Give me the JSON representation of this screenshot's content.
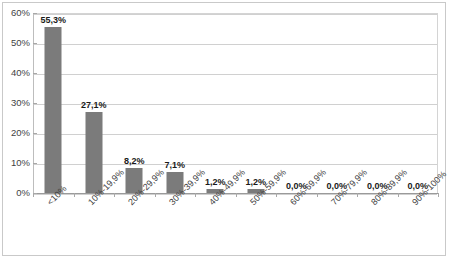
{
  "chart_data": {
    "type": "bar",
    "title": "",
    "subtitle": "",
    "xlabel": "",
    "ylabel": "",
    "categories": [
      "<10%",
      "10%-19,9%",
      "20%-29,9%",
      "30%-39,9%",
      "40%-49,9%",
      "50%-59,9%",
      "60%-69,9%",
      "70%-79,9%",
      "80%-89,9%",
      "90%-100%"
    ],
    "values": [
      55.3,
      27.1,
      8.2,
      7.1,
      1.2,
      1.2,
      0.0,
      0.0,
      0.0,
      0.0
    ],
    "data_labels": [
      "55,3%",
      "27,1%",
      "8,2%",
      "7,1%",
      "1,2%",
      "1,2%",
      "0,0%",
      "0,0%",
      "0,0%",
      "0,0%"
    ],
    "ylim": [
      0,
      60
    ],
    "ytick_values": [
      0,
      10,
      20,
      30,
      40,
      50,
      60
    ],
    "ytick_labels": [
      "0%",
      "10%",
      "20%",
      "30%",
      "40%",
      "50%",
      "60%"
    ],
    "grid": true,
    "legend": false,
    "legend_position": "none",
    "colors": {
      "bar": "#7b7b7b",
      "gridline": "#d0d0d0",
      "axis": "#9a9a9a",
      "border": "#c9c9c9",
      "label_text": "#1a1a1a",
      "tick_text": "#3f3f3f",
      "background": "#ffffff"
    }
  }
}
